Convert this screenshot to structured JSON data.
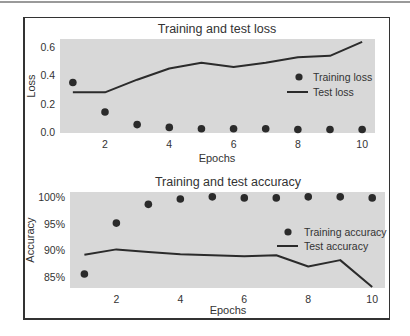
{
  "chart_data": [
    {
      "type": "scatter+line",
      "title": "Training and test loss",
      "xlabel": "Epochs",
      "ylabel": "Loss",
      "x": [
        1,
        2,
        3,
        4,
        5,
        6,
        7,
        8,
        9,
        10
      ],
      "xticks": [
        2,
        4,
        6,
        8,
        10
      ],
      "yticks": [
        0.0,
        0.2,
        0.4,
        0.6
      ],
      "ytick_labels": [
        "0.0",
        "0.2",
        "0.4",
        "0.6"
      ],
      "xlim": [
        0.6,
        10.4
      ],
      "ylim": [
        -0.01,
        0.66
      ],
      "grid": false,
      "legend_position": "center right",
      "series": [
        {
          "name": "Training loss",
          "style": "dots",
          "values": [
            0.35,
            0.14,
            0.05,
            0.03,
            0.02,
            0.02,
            0.02,
            0.015,
            0.015,
            0.015
          ]
        },
        {
          "name": "Test loss",
          "style": "line",
          "values": [
            0.28,
            0.28,
            0.37,
            0.45,
            0.49,
            0.46,
            0.49,
            0.53,
            0.54,
            0.64
          ]
        }
      ]
    },
    {
      "type": "scatter+line",
      "title": "Training and test accuracy",
      "xlabel": "Epochs",
      "ylabel": "Accuracy",
      "x": [
        1,
        2,
        3,
        4,
        5,
        6,
        7,
        8,
        9,
        10
      ],
      "xticks": [
        2,
        4,
        6,
        8,
        10
      ],
      "yticks": [
        0.85,
        0.9,
        0.95,
        1.0
      ],
      "ytick_labels": [
        "85%",
        "90%",
        "95%",
        "100%"
      ],
      "xlim": [
        0.55,
        10.4
      ],
      "ylim": [
        0.83,
        1.009
      ],
      "grid": false,
      "legend_position": "center right",
      "series": [
        {
          "name": "Training accuracy",
          "style": "dots",
          "values": [
            0.856,
            0.951,
            0.986,
            0.996,
            1.0,
            0.998,
            0.998,
            1.0,
            1.0,
            0.998
          ]
        },
        {
          "name": "Test accuracy",
          "style": "line",
          "values": [
            0.892,
            0.902,
            0.897,
            0.893,
            0.891,
            0.889,
            0.891,
            0.87,
            0.882,
            0.832
          ]
        }
      ]
    }
  ],
  "colors": {
    "plot_background": "#d8d8d8",
    "series": "#2b2b2b",
    "text": "#333333",
    "frame": "#333333"
  }
}
